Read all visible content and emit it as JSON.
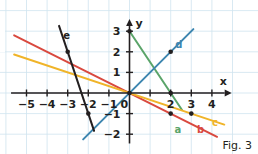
{
  "figure": {
    "caption": "Fig. 3",
    "background": "#ffffff"
  },
  "axes": {
    "x_label": "x",
    "y_label": "y",
    "origin_label": "0",
    "x_ticks": [
      {
        "value": -5,
        "label": "−5"
      },
      {
        "value": -4,
        "label": "−4"
      },
      {
        "value": -3,
        "label": "−3"
      },
      {
        "value": -2,
        "label": "−2"
      },
      {
        "value": -1,
        "label": "−1"
      },
      {
        "value": 2,
        "label": "2"
      },
      {
        "value": 3,
        "label": "3"
      },
      {
        "value": 4,
        "label": "4"
      }
    ],
    "y_ticks": [
      {
        "value": 3,
        "label": "3"
      },
      {
        "value": 2,
        "label": "2"
      },
      {
        "value": 1,
        "label": "1"
      },
      {
        "value": -1,
        "label": "−1"
      },
      {
        "value": -2,
        "label": "−2"
      }
    ],
    "axis_color": "#231f20",
    "grid_color": "#cfe3ef"
  },
  "chart_data": {
    "type": "line",
    "title": "Fig. 3",
    "xlabel": "x",
    "ylabel": "y",
    "xlim": [
      -5.7,
      4.9
    ],
    "ylim": [
      -2.4,
      3.3
    ],
    "grid": true,
    "legend": "inline-labels",
    "x_ticks": [
      -5,
      -4,
      -3,
      -2,
      -1,
      0,
      1,
      2,
      3,
      4
    ],
    "y_ticks": [
      -2,
      -1,
      0,
      1,
      2,
      3
    ],
    "series": [
      {
        "name": "a",
        "label": "a",
        "color": "#5aa469",
        "slope": -1.5,
        "intercept": 3,
        "equation": "y = -1.5x + 3",
        "x_range": [
          0.05,
          2.55
        ],
        "label_pos": {
          "x": 2.35,
          "y": -1.55
        },
        "points": [
          {
            "x": 0,
            "y": 3
          },
          {
            "x": 2,
            "y": 0
          }
        ]
      },
      {
        "name": "b",
        "label": "b",
        "color": "#d9493f",
        "slope": -0.5,
        "intercept": 0,
        "equation": "y = -0.5x",
        "x_range": [
          -5.6,
          4.25
        ],
        "label_pos": {
          "x": 3.45,
          "y": -1.55
        },
        "points": [
          {
            "x": 0,
            "y": 0
          },
          {
            "x": 2,
            "y": -1
          }
        ]
      },
      {
        "name": "c",
        "label": "c",
        "color": "#f0b429",
        "slope": -0.3333,
        "intercept": 0,
        "equation": "y = -x/3",
        "x_range": [
          -5.6,
          4.6
        ],
        "label_pos": {
          "x": 4.15,
          "y": -1.2
        },
        "points": [
          {
            "x": 0,
            "y": 0
          },
          {
            "x": 3,
            "y": -1
          }
        ]
      },
      {
        "name": "d",
        "label": "d",
        "color": "#3d86b0",
        "slope": 1,
        "intercept": 0,
        "equation": "y = x",
        "x_range": [
          -2.25,
          3.1
        ],
        "label_pos": {
          "x": 2.4,
          "y": 2.55
        },
        "points": [
          {
            "x": 0,
            "y": 0
          },
          {
            "x": 2,
            "y": 2
          }
        ]
      },
      {
        "name": "e",
        "label": "e",
        "color": "#231f20",
        "slope": -3,
        "intercept": -7,
        "equation": "y = -3x - 7",
        "x_range": [
          -3.42,
          -1.72
        ],
        "label_pos": {
          "x": -3.05,
          "y": 3.0
        },
        "points": [
          {
            "x": -3,
            "y": 2
          },
          {
            "x": -2,
            "y": -1
          }
        ]
      }
    ],
    "marked_points": [
      {
        "x": 0,
        "y": 3,
        "on": "a"
      },
      {
        "x": 2,
        "y": 0,
        "on": "a"
      },
      {
        "x": 0,
        "y": 0,
        "on": "b"
      },
      {
        "x": 2,
        "y": -1,
        "on": "b"
      },
      {
        "x": 3,
        "y": -1,
        "on": "c"
      },
      {
        "x": 2,
        "y": 2,
        "on": "d"
      },
      {
        "x": -3,
        "y": 2,
        "on": "e"
      },
      {
        "x": -2,
        "y": -1,
        "on": "e"
      }
    ]
  }
}
